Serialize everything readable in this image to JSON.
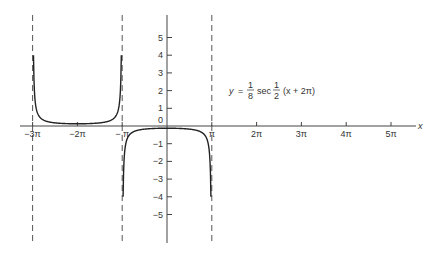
{
  "chart_data": {
    "type": "line",
    "title": "",
    "function_label": {
      "lhs": "y",
      "eq": "=",
      "coef_num": "1",
      "coef_den": "8",
      "func": "sec",
      "arg_num": "1",
      "arg_den": "2",
      "arg": "(x + 2π)"
    },
    "xlabel": "x",
    "ylabel": "",
    "x_ticks": [
      "−3π",
      "−2π",
      "− π",
      "π",
      "2π",
      "3π",
      "4π",
      "5π"
    ],
    "x_tick_values_pi": [
      -3,
      -2,
      -1,
      1,
      2,
      3,
      4,
      5
    ],
    "y_ticks": [
      "5",
      "4",
      "3",
      "2",
      "1",
      "0",
      "−1",
      "−2",
      "−3",
      "−4",
      "−5"
    ],
    "y_tick_values": [
      5,
      4,
      3,
      2,
      1,
      0,
      -1,
      -2,
      -3,
      -4,
      -5
    ],
    "xlim_pi": [
      -3.3,
      5.6
    ],
    "ylim": [
      -6.5,
      6.2
    ],
    "grid": false,
    "asymptotes_pi": [
      -3,
      -1,
      1
    ],
    "series": [
      {
        "name": "upper branch",
        "x_pi": [
          -2.95,
          -2.9,
          -2.8,
          -2.6,
          -2.4,
          -2.2,
          -2.0,
          -1.8,
          -1.6,
          -1.4,
          -1.2,
          -1.1,
          -1.05
        ],
        "y": [
          6.37,
          3.19,
          1.6,
          0.66,
          0.43,
          0.13,
          0.125,
          0.13,
          0.21,
          0.43,
          0.8,
          1.6,
          3.19
        ]
      },
      {
        "name": "lower branch",
        "x_pi": [
          -0.95,
          -0.9,
          -0.8,
          -0.6,
          -0.4,
          -0.2,
          0,
          0.2,
          0.4,
          0.6,
          0.8,
          0.9,
          0.95
        ],
        "y": [
          -3.19,
          -1.6,
          -0.8,
          -0.21,
          -0.15,
          -0.13,
          -0.125,
          -0.13,
          -0.15,
          -0.21,
          -0.8,
          -1.6,
          -3.19
        ]
      }
    ]
  }
}
